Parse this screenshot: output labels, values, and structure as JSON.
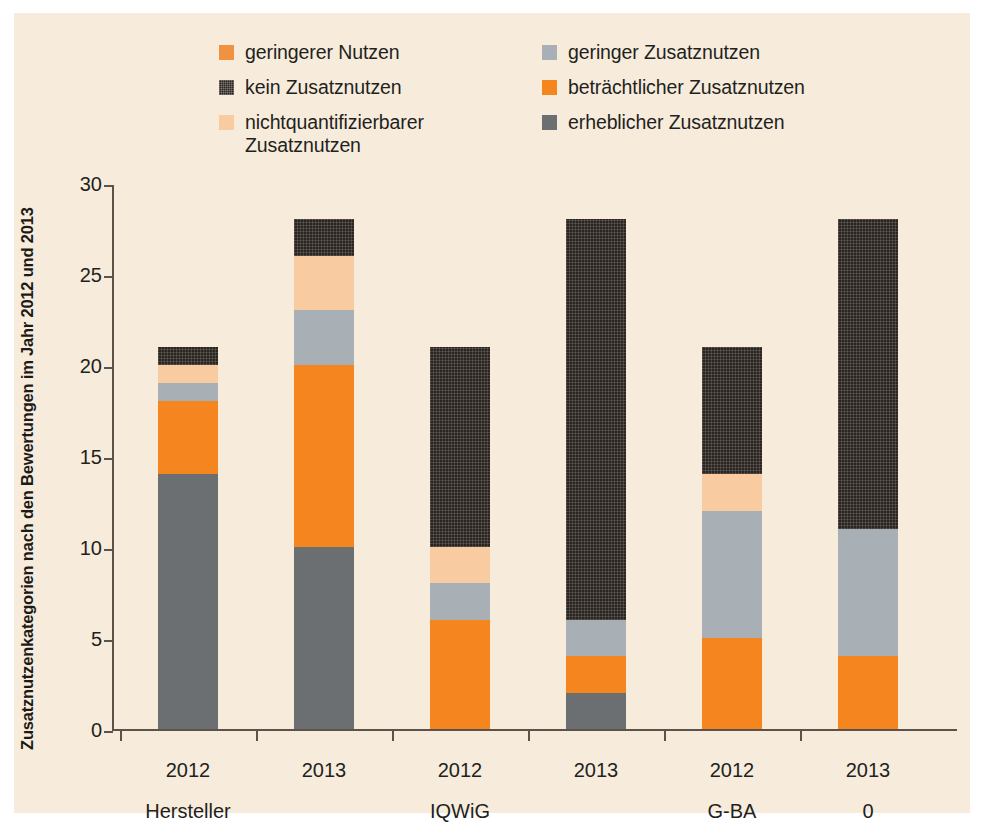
{
  "figure": {
    "background_color": "#f7ecdc",
    "axis_color": "#5d5249"
  },
  "ylabel": "Zusatznutzenkategorien nach den Bewertungen im Jahr 2012 und 2013",
  "legend": {
    "left_column": [
      {
        "label": "geringerer Nutzen",
        "color": "#F0923F",
        "icon": "legend-swatch-square",
        "textured": false
      },
      {
        "label": "kein Zusatznutzen",
        "color": "#2b2520",
        "icon": "legend-swatch-square",
        "textured": true
      },
      {
        "label": "nichtquantifizierbarer\nZusatznutzen",
        "color": "#F8CCA0",
        "icon": "legend-swatch-square",
        "textured": false
      }
    ],
    "right_column": [
      {
        "label": "geringer Zusatznutzen",
        "color": "#A8B0B5",
        "icon": "legend-swatch-square",
        "textured": false
      },
      {
        "label": "beträchtlicher Zusatznutzen",
        "color": "#F5861F",
        "icon": "legend-swatch-square",
        "textured": false
      },
      {
        "label": "erheblicher Zusatznutzen",
        "color": "#6B6F72",
        "icon": "legend-swatch-square",
        "textured": false
      }
    ]
  },
  "yaxis": {
    "ticks": [
      "0",
      "5",
      "10",
      "15",
      "20",
      "25",
      "30"
    ],
    "min": 0,
    "max": 30
  },
  "xaxis": {
    "year_labels": [
      "2012",
      "2013",
      "2012",
      "2013",
      "2012",
      "2013"
    ],
    "group_labels": [
      "Hersteller",
      "",
      "IQWiG",
      "",
      "G-BA",
      "0"
    ]
  },
  "chart_data": {
    "type": "bar",
    "subtype": "stacked",
    "title": "",
    "xlabel": "",
    "ylabel": "Zusatznutzenkategorien nach den Bewertungen im Jahr 2012 und 2013",
    "ylim": [
      0,
      30
    ],
    "yticks": [
      0,
      5,
      10,
      15,
      20,
      25,
      30
    ],
    "grid": false,
    "legend_position": "top",
    "categories": [
      "2012",
      "2013",
      "2012",
      "2013",
      "2012",
      "2013"
    ],
    "groups": [
      "Hersteller",
      "Hersteller",
      "IQWiG",
      "IQWiG",
      "G-BA",
      "G-BA"
    ],
    "series": [
      {
        "name": "erheblicher Zusatznutzen",
        "color": "#6B6F72",
        "values": [
          14,
          10,
          0,
          2,
          0,
          0
        ]
      },
      {
        "name": "beträchtlicher Zusatznutzen",
        "color": "#F5861F",
        "values": [
          4,
          10,
          6,
          2,
          5,
          4
        ]
      },
      {
        "name": "geringer Zusatznutzen",
        "color": "#A8B0B5",
        "values": [
          1,
          3,
          2,
          2,
          7,
          7
        ]
      },
      {
        "name": "nichtquantifizierbarer Zusatznutzen",
        "color": "#F8CCA0",
        "values": [
          1,
          3,
          2,
          0,
          2,
          0
        ]
      },
      {
        "name": "geringerer Nutzen",
        "color": "#F0923F",
        "values": [
          0,
          0,
          0,
          0,
          0,
          0
        ]
      },
      {
        "name": "kein Zusatznutzen",
        "color": "#2b2520",
        "values": [
          1,
          2,
          11,
          22,
          7,
          17
        ]
      }
    ],
    "totals": [
      21,
      28,
      21,
      28,
      21,
      28
    ]
  }
}
